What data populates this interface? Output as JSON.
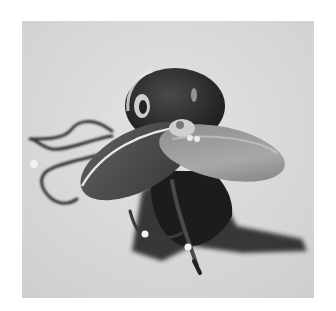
{
  "image": {
    "subject": "Grayscale photograph of a spinner fishing lure with propeller blade and treble hooks",
    "alt": "Fishing lure with spinner blade and hooks casting a shadow on a light surface",
    "colors": {
      "background_border": "#ffffff",
      "surface": "#d6d6d6",
      "surface_light": "#e2e2e2",
      "lure_body": "#2e2e2e",
      "blade": "#6a6a6a",
      "blade_highlight": "#bdbdbd",
      "shadow": "#1e1e1e",
      "hook": "#3a3a3a",
      "hook_glint": "#f4f4f4"
    }
  }
}
